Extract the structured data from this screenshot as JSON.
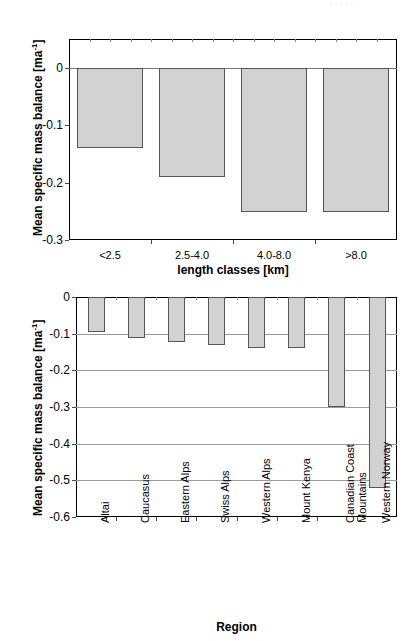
{
  "page": {
    "width": 418,
    "height": 641,
    "background": "#ffffff",
    "top_artifact": "[ ] [ ] [ ]"
  },
  "colors": {
    "bar_fill": "#d2d2d2",
    "bar_edge": "#555555",
    "grid": "#9a9a9a",
    "axis": "#000000",
    "text": "#000000"
  },
  "chart_data": [
    {
      "id": "chart-length-classes",
      "type": "bar",
      "title": "",
      "categories": [
        "<2.5",
        "2.5-4.0",
        "4.0-8.0",
        ">8.0"
      ],
      "values": [
        -0.14,
        -0.19,
        -0.25,
        -0.25
      ],
      "xlabel": "length classes [km]",
      "ylabel": "Mean specific mass balance [ma",
      "ylabel_sup": "-1",
      "ylabel_tail": "]",
      "ylim": [
        -0.3,
        0.05
      ],
      "yticks": [
        0,
        -0.1,
        -0.2,
        -0.3
      ],
      "ytick_labels": [
        "0",
        "-0.1",
        "-0.2",
        "-0.3"
      ],
      "grid": false,
      "legend": "none"
    },
    {
      "id": "chart-regions",
      "type": "bar",
      "title": "",
      "categories": [
        "Altai",
        "Caucasus",
        "Eastern Alps",
        "Swiss Alps",
        "Western Alps",
        "Mount Kenya",
        "Canadian Coast Mountains",
        "Western Norway"
      ],
      "category_lines": [
        [
          "Altai"
        ],
        [
          "Caucasus"
        ],
        [
          "Eastern Alps"
        ],
        [
          "Swiss Alps"
        ],
        [
          "Western Alps"
        ],
        [
          "Mount Kenya"
        ],
        [
          "Canadian Coast",
          "Mountains"
        ],
        [
          "Western Norway"
        ]
      ],
      "values": [
        -0.095,
        -0.113,
        -0.122,
        -0.132,
        -0.14,
        -0.14,
        -0.3,
        -0.52
      ],
      "xlabel": "Region",
      "ylabel": "Mean specific mass balance [ma",
      "ylabel_sup": "-1",
      "ylabel_tail": "]",
      "ylim": [
        -0.6,
        0.0
      ],
      "yticks": [
        0,
        -0.1,
        -0.2,
        -0.3,
        -0.4,
        -0.5,
        -0.6
      ],
      "ytick_labels": [
        "0",
        "-0.1",
        "-0.2",
        "-0.3",
        "-0.4",
        "-0.5",
        "-0.6"
      ],
      "grid": true,
      "legend": "none"
    }
  ]
}
